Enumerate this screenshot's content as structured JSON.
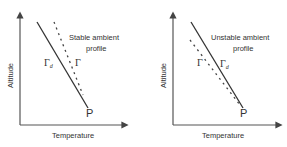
{
  "panels": [
    {
      "id": "stable",
      "title_line1": "Stable ambient",
      "title_line2": "profile",
      "xlabel": "Temperature",
      "ylabel": "Altitude",
      "solid_line_label": "Γ",
      "solid_line_sub": "d",
      "dotted_line_label": "Γ",
      "point_label": "P"
    },
    {
      "id": "unstable",
      "title_line1": "Unstable ambient",
      "title_line2": "profile",
      "xlabel": "Temperature",
      "ylabel": "Altitude",
      "solid_line_label": "Γ",
      "solid_line_sub": "d",
      "dotted_line_label": "Γ",
      "point_label": "P"
    }
  ],
  "colors": {
    "line": "#333333",
    "axis": "#555555",
    "text": "#333333"
  }
}
